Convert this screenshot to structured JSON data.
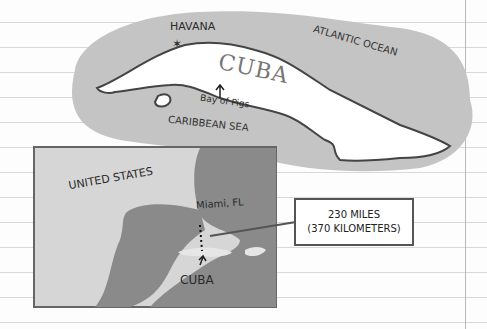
{
  "labels": {
    "havana": "HAVANA",
    "atlantic": "ATLANTIC OCEAN",
    "cuba_title": "CUBA",
    "bay_of_pigs": "Bay of Pigs",
    "caribbean": "CARIBBEAN SEA",
    "united_states": "UNITED STATES",
    "miami": "Miami, FL",
    "cuba_small": "CUBA"
  },
  "distance": {
    "miles": "230 MILES",
    "kilometers": "(370 KILOMETERS)"
  },
  "colors": {
    "paper": "#fdfdfd",
    "rule_line": "#d8d8d8",
    "water_highlight": "#c4c4c4",
    "land_dark": "#8a8a8a",
    "outline": "#444444"
  }
}
